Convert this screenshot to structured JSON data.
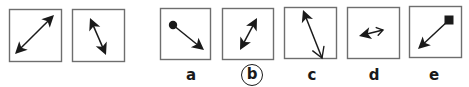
{
  "puzzle": {
    "type": "visual-analogy",
    "stroke_color": "#1a1a1a",
    "box_border_color": "#6e6e6e",
    "selected_answer": "b",
    "example": [
      {
        "id": "ex1",
        "box": {
          "x": 9,
          "y": 9,
          "w": 52,
          "h": 52
        },
        "arrow": {
          "x1": 15,
          "y1": 54,
          "x2": 54,
          "y2": 15,
          "start": "filled",
          "end": "filled"
        }
      },
      {
        "id": "ex2",
        "box": {
          "x": 72,
          "y": 9,
          "w": 52,
          "h": 52
        },
        "arrow": {
          "x1": 90,
          "y1": 18,
          "x2": 106,
          "y2": 55,
          "start": "filled",
          "end": "filled"
        }
      }
    ],
    "options": [
      {
        "label": "a",
        "circled": false,
        "label_x": 191,
        "box": {
          "x": 160,
          "y": 8,
          "w": 50,
          "h": 51
        },
        "arrow": {
          "x1": 173,
          "y1": 25,
          "x2": 204,
          "y2": 50,
          "start": "dot",
          "end": "filled"
        }
      },
      {
        "label": "b",
        "circled": true,
        "label_x": 252,
        "box": {
          "x": 222,
          "y": 8,
          "w": 51,
          "h": 51
        },
        "arrow": {
          "x1": 257,
          "y1": 18,
          "x2": 240,
          "y2": 50,
          "start": "filled",
          "end": "filled"
        }
      },
      {
        "label": "c",
        "circled": false,
        "label_x": 312,
        "box": {
          "x": 284,
          "y": 7,
          "w": 52,
          "h": 51
        },
        "arrow": {
          "x1": 303,
          "y1": 10,
          "x2": 322,
          "y2": 58,
          "start": "filled",
          "end": "open"
        }
      },
      {
        "label": "d",
        "circled": false,
        "label_x": 374,
        "box": {
          "x": 347,
          "y": 7,
          "w": 52,
          "h": 51
        },
        "arrow": {
          "x1": 359,
          "y1": 36,
          "x2": 383,
          "y2": 30,
          "start": "filled",
          "end": "open-small"
        }
      },
      {
        "label": "e",
        "circled": false,
        "label_x": 434,
        "box": {
          "x": 409,
          "y": 6,
          "w": 52,
          "h": 51
        },
        "arrow": {
          "x1": 449,
          "y1": 20,
          "x2": 418,
          "y2": 49,
          "start": "square",
          "end": "filled"
        }
      }
    ]
  }
}
